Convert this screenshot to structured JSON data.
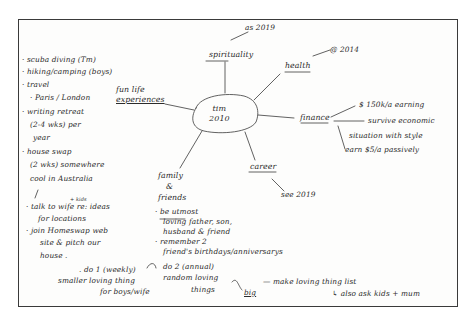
{
  "mindmap": {
    "center": {
      "line1": "tim",
      "line2": "2010"
    },
    "branches": {
      "spirituality": {
        "label": "spirituality",
        "note": "as 2019"
      },
      "health": {
        "label": "health",
        "note": "@ 2014"
      },
      "finance": {
        "label": "finance",
        "items": [
          "$ 150k/a earning",
          "survive economic",
          "situation with style",
          "earn $5/a passively"
        ]
      },
      "career": {
        "label": "career",
        "note": "see 2019"
      },
      "family": {
        "label_line1": "family",
        "label_line2": "&",
        "label_line3": "friends",
        "items": [
          "· be utmost",
          "loving father, son,",
          "husband & friend",
          "· remember 2",
          "friend's birthdays/anniversarys"
        ],
        "do1": ". do 1 (weekly)",
        "do1_line2": "smaller loving thing",
        "do1_line3": "for boys/wife",
        "do2": "do 2 (annual)",
        "do2_line2": "random loving",
        "do2_line3": "things",
        "big": "big",
        "make_list": "— make loving thing list",
        "ask": "↳ also ask kids + mum"
      },
      "fun": {
        "label_line1": "fun life",
        "label_line2": "experiences",
        "items": [
          "· scuba diving (Tm)",
          "· hiking/camping (boys)",
          "· travel",
          "· Paris / London",
          "· writing retreat",
          "(2-4 wks) per",
          "year",
          "· house swap",
          "(2 wks) somewhere",
          "cool in Australia",
          "· talk to wife re: ideas",
          "for locations",
          "· join Homeswap web",
          "site & pitch our",
          "house ."
        ],
        "kids_note": "+ kids"
      }
    }
  },
  "colors": {
    "ink": "#2b2b2b",
    "paper": "#fdfdfc",
    "border": "#3a3a3a"
  }
}
